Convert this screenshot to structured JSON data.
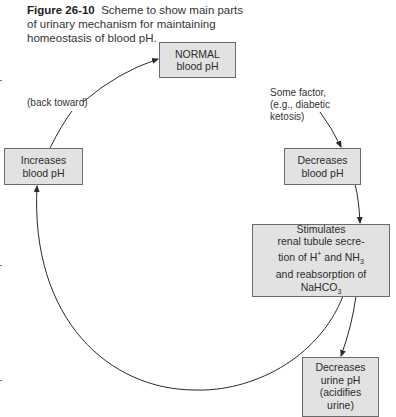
{
  "caption": {
    "figure_label": "Figure 26-10",
    "text": "Scheme to show main parts of urinary mechanism for maintaining homeostasis of blood pH."
  },
  "nodes": {
    "normal": {
      "text": "NORMAL\nblood pH"
    },
    "decreases_blood": {
      "text": "Decreases\nblood pH"
    },
    "stimulates": {
      "line1": "Stimulates",
      "line2": "renal tubule secre-",
      "line3a": "tion of H",
      "line3_sup": "+",
      "line3b": " and NH",
      "line3_sub": "3",
      "line4": "and reabsorption of",
      "line5a": "NaHCO",
      "line5_sub": "3"
    },
    "decreases_urine": {
      "text": "Decreases\nurine pH\n(acidifies\nurine)"
    },
    "increases_blood": {
      "text": "Increases\nblood pH"
    }
  },
  "labels": {
    "some_factor": "Some factor,\n(e.g., diabetic\nketosis)",
    "back_toward": "(back toward)"
  },
  "colors": {
    "box_fill": "#e2e2e2",
    "box_border": "#6a6a6a",
    "line": "#2a2a2a"
  }
}
